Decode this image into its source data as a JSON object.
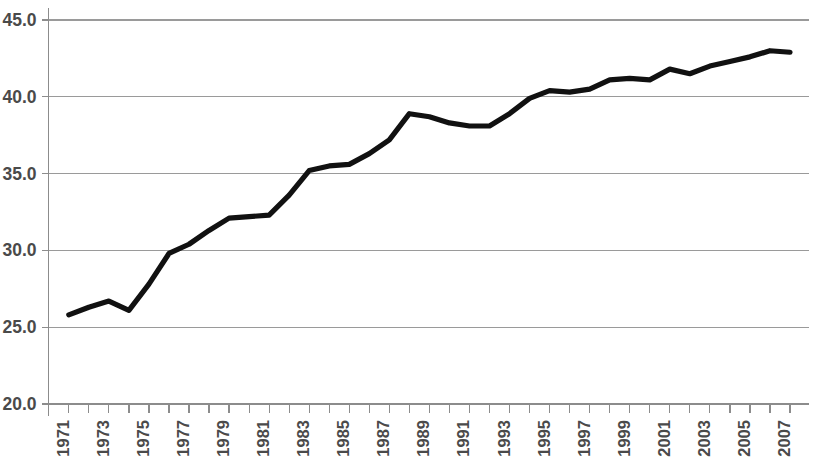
{
  "chart_data": {
    "type": "line",
    "title": "",
    "subtitle": "",
    "xlabel": "",
    "ylabel": "",
    "xlim": [
      1971,
      2007
    ],
    "ylim": [
      20.0,
      45.0
    ],
    "grid": true,
    "legend": false,
    "legend_position": "none",
    "line_color": "#111111",
    "grid_color": "#9a9a9a",
    "axis_color": "#8c8c8c",
    "y_ticks": [
      20.0,
      25.0,
      30.0,
      35.0,
      40.0,
      45.0
    ],
    "y_tick_labels": [
      "20.0",
      "25.0",
      "30.0",
      "35.0",
      "40.0",
      "45.0"
    ],
    "x_ticks": [
      1971,
      1972,
      1973,
      1974,
      1975,
      1976,
      1977,
      1978,
      1979,
      1980,
      1981,
      1982,
      1983,
      1984,
      1985,
      1986,
      1987,
      1988,
      1989,
      1990,
      1991,
      1992,
      1993,
      1994,
      1995,
      1996,
      1997,
      1998,
      1999,
      2000,
      2001,
      2002,
      2003,
      2004,
      2005,
      2006,
      2007
    ],
    "x_tick_labels": [
      "1971",
      "",
      "1973",
      "",
      "1975",
      "",
      "1977",
      "",
      "1979",
      "",
      "1981",
      "",
      "1983",
      "",
      "1985",
      "",
      "1987",
      "",
      "1989",
      "",
      "1991",
      "",
      "1993",
      "",
      "1995",
      "",
      "1997",
      "",
      "1999",
      "",
      "2001",
      "",
      "2003",
      "",
      "2005",
      "",
      "2007"
    ],
    "x_tick_label_rotation": -90,
    "series": [
      {
        "name": "series-1",
        "x": [
          1971,
          1972,
          1973,
          1974,
          1975,
          1976,
          1977,
          1978,
          1979,
          1980,
          1981,
          1982,
          1983,
          1984,
          1985,
          1986,
          1987,
          1988,
          1989,
          1990,
          1991,
          1992,
          1993,
          1994,
          1995,
          1996,
          1997,
          1998,
          1999,
          2000,
          2001,
          2002,
          2003,
          2004,
          2005,
          2006,
          2007
        ],
        "values": [
          25.8,
          26.3,
          26.7,
          26.1,
          27.8,
          29.8,
          30.4,
          31.3,
          32.1,
          32.2,
          32.3,
          33.6,
          35.2,
          35.5,
          35.6,
          36.3,
          37.2,
          38.9,
          38.7,
          38.3,
          38.1,
          38.1,
          38.9,
          39.9,
          40.4,
          40.3,
          40.5,
          41.1,
          41.2,
          41.1,
          41.8,
          41.5,
          42.0,
          42.3,
          42.6,
          43.0,
          42.9
        ]
      }
    ]
  }
}
